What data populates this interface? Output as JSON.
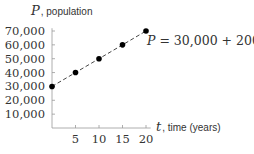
{
  "chart_data": {
    "type": "line",
    "title": "",
    "xlabel": "t, time (years)",
    "ylabel": "P, population",
    "x_var": "t",
    "x_label_rest": ", time (years)",
    "y_var": "P",
    "y_label_rest": ", population",
    "x": [
      0,
      5,
      10,
      15,
      20
    ],
    "series": [
      {
        "name": "P = 30,000 + 2000t",
        "values": [
          30000,
          40000,
          50000,
          60000,
          70000
        ],
        "style": "dashed",
        "markers": true
      }
    ],
    "xticks": [
      5,
      10,
      15,
      20
    ],
    "xtick_labels": [
      "5",
      "10",
      "15",
      "20"
    ],
    "yticks": [
      10000,
      20000,
      30000,
      40000,
      50000,
      60000,
      70000
    ],
    "ytick_labels": [
      "10,000",
      "20,000",
      "30,000",
      "40,000",
      "50,000",
      "60,000",
      "70,000"
    ],
    "xlim": [
      0,
      21
    ],
    "ylim": [
      0,
      72000
    ],
    "grid": false,
    "annotation": "P = 30,000 + 2000t",
    "annotation_parts": {
      "lhs": "P",
      "eq": " = 30,000 + 2000",
      "var": "t"
    }
  },
  "colors": {
    "axis": "#999999",
    "line": "#333333",
    "marker": "#000000",
    "text": "#333333"
  }
}
